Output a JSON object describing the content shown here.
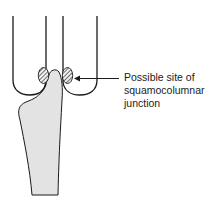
{
  "diagram": {
    "annotation": {
      "lines": [
        "Possible site of",
        "squamocolumnar",
        "junction"
      ]
    },
    "colors": {
      "outline": "#1a1a1a",
      "tissue_fill": "#e3e3e3",
      "hatch": "#333333",
      "background": "#ffffff"
    },
    "elements": [
      "left-fornix-u-shape",
      "right-fornix-u-shape",
      "cervix-stalk",
      "left-hatched-junction-site",
      "right-hatched-junction-site",
      "pointer-arrow"
    ]
  }
}
